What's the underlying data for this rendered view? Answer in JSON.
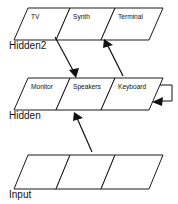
{
  "diagram": {
    "type": "layered-network-diagram",
    "background_color": "#ffffff",
    "line_color": "#111111",
    "layers": [
      {
        "id": "hidden2",
        "label": "Hidden2",
        "cells": [
          {
            "label": "TV"
          },
          {
            "label": "Synth"
          },
          {
            "label": "Terminal"
          }
        ]
      },
      {
        "id": "hidden",
        "label": "Hidden",
        "cells": [
          {
            "label": "Monitor"
          },
          {
            "label": "Speakers"
          },
          {
            "label": "Keyboard"
          }
        ]
      },
      {
        "id": "input",
        "label": "Input",
        "cells": [
          {
            "label": ""
          },
          {
            "label": ""
          },
          {
            "label": ""
          }
        ]
      }
    ],
    "connections": [
      {
        "id": "synth-to-speakers",
        "from": "Synth",
        "to": "Speakers",
        "direction": "down"
      },
      {
        "id": "keyboard-to-terminal",
        "from": "Keyboard",
        "to": "Terminal",
        "direction": "up"
      },
      {
        "id": "input-to-speakers",
        "from": "Input",
        "to": "Speakers",
        "direction": "up"
      },
      {
        "id": "keyboard-self-loop",
        "from": "Keyboard",
        "to": "Keyboard",
        "direction": "self"
      }
    ]
  }
}
